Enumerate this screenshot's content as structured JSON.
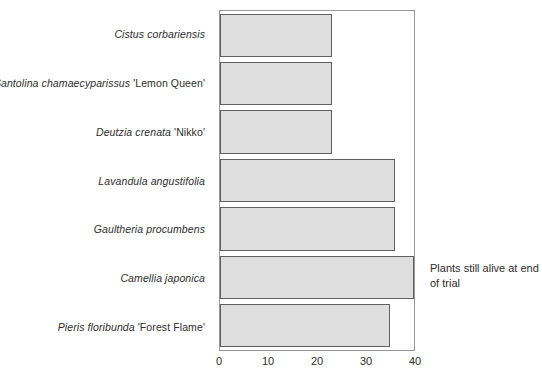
{
  "chart_data": {
    "type": "bar",
    "orientation": "horizontal",
    "title": "",
    "xlabel": "",
    "ylabel": "",
    "categories": [
      {
        "species": "Cistus corbariensis",
        "cultivar": ""
      },
      {
        "species": "Santolina chamaecyparissus",
        "cultivar": "'Lemon Queen'"
      },
      {
        "species": "Deutzia crenata",
        "cultivar": "'Nikko'"
      },
      {
        "species": "Lavandula angustifolia",
        "cultivar": ""
      },
      {
        "species": "Gaultheria procumbens",
        "cultivar": ""
      },
      {
        "species": "Camellia japonica",
        "cultivar": ""
      },
      {
        "species": "Pieris floribunda",
        "cultivar": "'Forest Flame'"
      }
    ],
    "values": [
      23,
      23,
      23,
      36,
      36,
      40,
      35
    ],
    "xlim": [
      0,
      40
    ],
    "xticks": [
      0,
      10,
      20,
      30,
      40
    ],
    "grid": false,
    "legend": "none",
    "annotation": "Plants still alive at end of trial",
    "colors": {
      "bar_fill": "#dedede",
      "bar_border": "#5f5f5f",
      "plot_border": "#979797",
      "text": "#2e2e2e"
    }
  }
}
